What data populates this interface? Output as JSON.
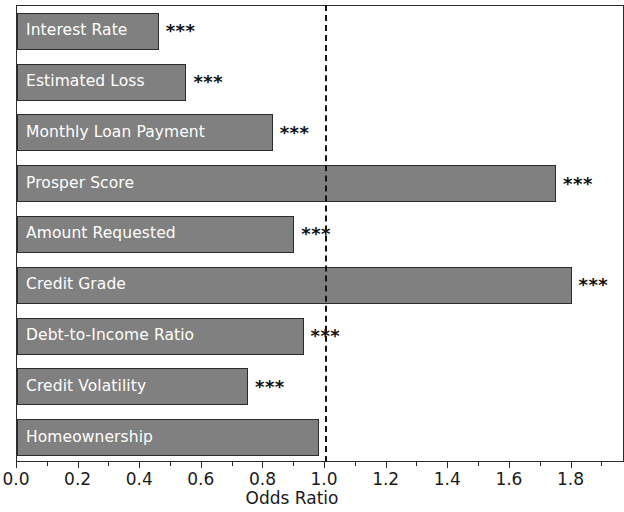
{
  "chart_data": {
    "type": "bar",
    "orientation": "horizontal",
    "title": "",
    "xlabel": "Odds Ratio",
    "ylabel": "",
    "xlim": [
      0.0,
      1.9736
    ],
    "xticks": [
      0.0,
      0.2,
      0.4,
      0.6,
      0.8,
      1.0,
      1.2,
      1.4,
      1.6,
      1.8
    ],
    "xticklabels": [
      "0.0",
      "0.2",
      "0.4",
      "0.6",
      "0.8",
      "1.0",
      "1.2",
      "1.4",
      "1.6",
      "1.8"
    ],
    "grid": false,
    "legend": null,
    "reference_line": {
      "value": 1.0,
      "style": "dashed",
      "color": "#141414",
      "label": ""
    },
    "bar_color": "#808080",
    "bar_edge_color": "#2b2b2b",
    "bar_label_color": "#ffffff",
    "categories": [
      "Interest Rate",
      "Estimated Loss",
      "Monthly Loan Payment",
      "Prosper Score",
      "Amount Requested",
      "Credit Grade",
      "Debt-to-Income Ratio",
      "Credit Volatility",
      "Homeownership"
    ],
    "values": [
      0.46,
      0.55,
      0.83,
      1.75,
      0.9,
      1.8,
      0.93,
      0.75,
      0.98
    ],
    "annotations": [
      "***",
      "***",
      "***",
      "***",
      "***",
      "***",
      "***",
      "***",
      ""
    ],
    "bars": [
      {
        "label": "Interest Rate",
        "value": 0.46,
        "significance": "***"
      },
      {
        "label": "Estimated Loss",
        "value": 0.55,
        "significance": "***"
      },
      {
        "label": "Monthly Loan Payment",
        "value": 0.83,
        "significance": "***"
      },
      {
        "label": "Prosper Score",
        "value": 1.75,
        "significance": "***"
      },
      {
        "label": "Amount Requested",
        "value": 0.9,
        "significance": "***"
      },
      {
        "label": "Credit Grade",
        "value": 1.8,
        "significance": "***"
      },
      {
        "label": "Debt-to-Income Ratio",
        "value": 0.93,
        "significance": "***"
      },
      {
        "label": "Credit Volatility",
        "value": 0.75,
        "significance": "***"
      },
      {
        "label": "Homeownership",
        "value": 0.98,
        "significance": ""
      }
    ]
  }
}
